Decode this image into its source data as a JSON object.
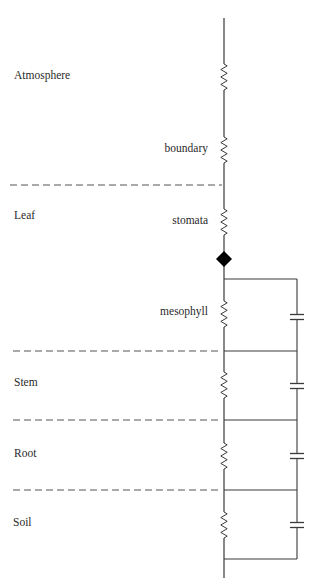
{
  "colors": {
    "line": "#3a3a3a",
    "dash": "#555555",
    "node": "#000000",
    "text": "#2a2a2a"
  },
  "zones": [
    {
      "label": "Atmosphere",
      "x": 14,
      "y": 70
    },
    {
      "label": "Leaf",
      "x": 14,
      "y": 210
    },
    {
      "label": "Stem",
      "x": 14,
      "y": 377
    },
    {
      "label": "Root",
      "x": 14,
      "y": 448
    },
    {
      "label": "Soil",
      "x": 13,
      "y": 517
    }
  ],
  "resistance_labels": [
    {
      "label": "boundary",
      "right": 107,
      "y": 143
    },
    {
      "label": "stomata",
      "right": 107,
      "y": 215
    },
    {
      "label": "mesophyll",
      "right": 107,
      "y": 306
    }
  ],
  "boundaries": [
    {
      "x1": 10,
      "x2": 222,
      "y": 185
    },
    {
      "x1": 13,
      "x2": 222,
      "y": 351
    },
    {
      "x1": 13,
      "x2": 222,
      "y": 420
    },
    {
      "x1": 13,
      "x2": 222,
      "y": 490
    }
  ],
  "circuit": {
    "main_x": 224,
    "top_y": 18,
    "bottom_y": 578,
    "rail_x": 297,
    "resistors": [
      {
        "name": "atmosphere",
        "y1": 64,
        "y2": 90
      },
      {
        "name": "boundary",
        "y1": 137,
        "y2": 163
      },
      {
        "name": "stomata",
        "y1": 209,
        "y2": 235
      },
      {
        "name": "mesophyll",
        "y1": 301,
        "y2": 327
      },
      {
        "name": "stem",
        "y1": 372,
        "y2": 398
      },
      {
        "name": "root",
        "y1": 443,
        "y2": 469
      },
      {
        "name": "soil",
        "y1": 512,
        "y2": 538
      }
    ],
    "node": {
      "x": 224,
      "y": 259,
      "r": 8
    },
    "rungs": [
      279,
      351,
      420,
      490,
      559
    ],
    "capacitors": [
      317,
      386,
      456,
      525
    ]
  }
}
